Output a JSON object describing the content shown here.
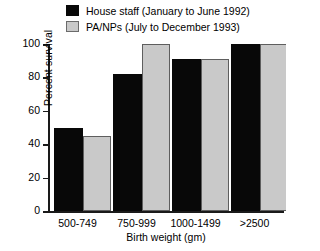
{
  "chart_data": {
    "type": "bar",
    "title": "",
    "xlabel": "Birth weight (gm)",
    "ylabel": "Percent survival",
    "categories": [
      "500-749",
      "750-999",
      "1000-1499",
      ">2500"
    ],
    "series": [
      {
        "name": "House staff (January to June 1992)",
        "color": "#080808",
        "swatch": "black",
        "values": [
          50,
          82,
          91,
          100
        ]
      },
      {
        "name": "PA/NPs (July to December 1993)",
        "color": "#c9c9c9",
        "swatch": "gray",
        "values": [
          45,
          100,
          91,
          100
        ]
      }
    ],
    "ylim": [
      0,
      100
    ],
    "yticks": [
      0,
      20,
      40,
      60,
      80,
      100
    ],
    "ytick_labels": [
      "0",
      "20",
      "40",
      "60",
      "80",
      "100"
    ],
    "grid": false,
    "legend_position": "top"
  }
}
